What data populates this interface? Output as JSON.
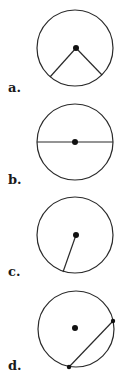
{
  "figures": [
    {
      "id": "a",
      "label": "a.",
      "description": "circle with center point and two radii forming a central angle",
      "circle": {
        "cx": 75,
        "cy": 48,
        "r": 38
      },
      "center_dot": {
        "cx": 76,
        "cy": 48
      },
      "segments": [
        {
          "x1": 76,
          "y1": 48,
          "x2": 50,
          "y2": 77
        },
        {
          "x1": 76,
          "y1": 48,
          "x2": 102,
          "y2": 75
        }
      ],
      "endpoint_dots": [],
      "label_pos": {
        "x": 8,
        "y": 92
      }
    },
    {
      "id": "b",
      "label": "b.",
      "description": "circle with diameter through center",
      "circle": {
        "cx": 75,
        "cy": 142,
        "r": 38
      },
      "center_dot": {
        "cx": 75,
        "cy": 142
      },
      "segments": [
        {
          "x1": 37,
          "y1": 142,
          "x2": 113,
          "y2": 142
        }
      ],
      "endpoint_dots": [],
      "label_pos": {
        "x": 8,
        "y": 184
      }
    },
    {
      "id": "c",
      "label": "c.",
      "description": "circle with a single radius",
      "circle": {
        "cx": 75,
        "cy": 235,
        "r": 38
      },
      "center_dot": {
        "cx": 76,
        "cy": 235
      },
      "segments": [
        {
          "x1": 76,
          "y1": 235,
          "x2": 63,
          "y2": 272
        }
      ],
      "endpoint_dots": [],
      "label_pos": {
        "x": 8,
        "y": 276
      }
    },
    {
      "id": "d",
      "label": "d.",
      "description": "circle with center point and a chord",
      "circle": {
        "cx": 76,
        "cy": 329,
        "r": 38
      },
      "center_dot": {
        "cx": 75,
        "cy": 328
      },
      "segments": [
        {
          "x1": 113,
          "y1": 321,
          "x2": 69,
          "y2": 367
        }
      ],
      "endpoint_dots": [
        {
          "cx": 113,
          "cy": 321
        },
        {
          "cx": 69,
          "cy": 367
        }
      ],
      "label_pos": {
        "x": 8,
        "y": 370
      }
    }
  ]
}
